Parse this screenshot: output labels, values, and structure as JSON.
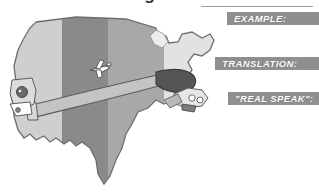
{
  "page": {
    "background_color": "#ffffff",
    "heading": {
      "text": "Lesson 1  •  Getting Started",
      "clipped": "true"
    }
  },
  "banners": {
    "accent_color": "#8f8f8f",
    "text_color": "#ffffff",
    "items": [
      {
        "id": "example",
        "label": "EXAMPLE:"
      },
      {
        "id": "translation",
        "label": "TRANSLATION:"
      },
      {
        "id": "realspeak",
        "label": "\"REAL SPEAK\":"
      }
    ]
  },
  "map": {
    "name": "united-states-map",
    "outline_color": "#6e6e6e",
    "bands": [
      {
        "id": "pacific",
        "label": "",
        "fill": "#cfcfcf"
      },
      {
        "id": "mountain",
        "label": "",
        "fill": "#8a8a8a"
      },
      {
        "id": "central",
        "label": "",
        "fill": "#a8a8a8"
      },
      {
        "id": "eastern",
        "label": "",
        "fill": "#e2e2e2"
      }
    ],
    "illustrations": [
      {
        "id": "airplane",
        "name": "airplane-icon"
      },
      {
        "id": "arm-stretch",
        "name": "stretching-arm-illustration"
      },
      {
        "id": "west-character",
        "name": "west-coast-character"
      },
      {
        "id": "east-character",
        "name": "east-coast-character"
      }
    ]
  }
}
